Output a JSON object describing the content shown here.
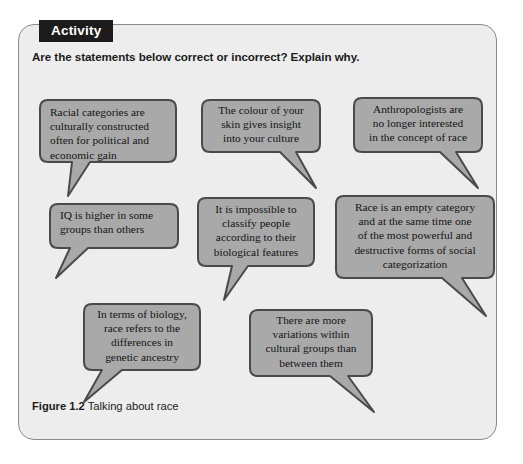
{
  "panel": {
    "badge_label": "Activity",
    "intro_text": "Are the statements below correct or incorrect? Explain why.",
    "background_color": "#ededed",
    "border_color": "#8b8b8b",
    "badge_background_color": "#1c1c1c",
    "badge_text_color": "#ffffff"
  },
  "bubbles": [
    {
      "id": "racial-categories",
      "text": "Racial categories are\nculturally constructed\noften for political and\neconomic gain",
      "align": "left",
      "tail": "down-left",
      "fill_color": "#a9a9a9",
      "border_color": "#4a4a4a"
    },
    {
      "id": "colour-of-skin",
      "text": "The colour of your\nskin gives insight\ninto your culture",
      "align": "center",
      "tail": "down-right",
      "fill_color": "#a9a9a9",
      "border_color": "#4a4a4a"
    },
    {
      "id": "anthropologists",
      "text": "Anthropologists are\nno longer interested\nin the concept of race",
      "align": "center",
      "tail": "down-right",
      "fill_color": "#a9a9a9",
      "border_color": "#4a4a4a"
    },
    {
      "id": "iq-higher",
      "text": "IQ is higher in some\ngroups than others",
      "align": "left",
      "tail": "down-left",
      "fill_color": "#a9a9a9",
      "border_color": "#4a4a4a"
    },
    {
      "id": "impossible-to-classify",
      "text": "It is impossible to\nclassify people\naccording to their\nbiological features",
      "align": "center",
      "tail": "down-left",
      "fill_color": "#a9a9a9",
      "border_color": "#4a4a4a"
    },
    {
      "id": "race-empty-category",
      "text": "Race is an empty category\nand at the same time one\nof the most powerful and\ndestructive forms of social\ncategorization",
      "align": "center",
      "tail": "down-right",
      "fill_color": "#a9a9a9",
      "border_color": "#4a4a4a"
    },
    {
      "id": "terms-of-biology",
      "text": "In terms of biology,\nrace refers to the\ndifferences in\ngenetic ancestry",
      "align": "center",
      "tail": "down-left",
      "fill_color": "#a9a9a9",
      "border_color": "#4a4a4a"
    },
    {
      "id": "more-variations",
      "text": "There are more\nvariations within\ncultural groups than\nbetween them",
      "align": "center",
      "tail": "down-right",
      "fill_color": "#a9a9a9",
      "border_color": "#4a4a4a"
    }
  ],
  "figure": {
    "label": "Figure 1.2",
    "caption": "Talking about race"
  }
}
